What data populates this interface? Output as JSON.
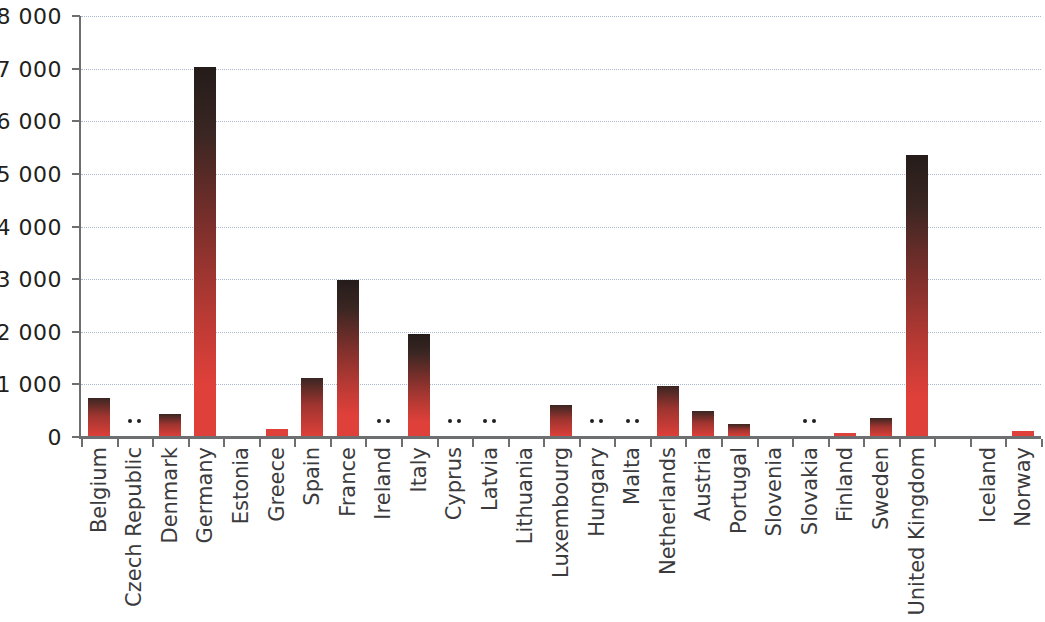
{
  "chart_data": {
    "type": "bar",
    "title": "",
    "subtitle": "",
    "xlabel": "",
    "ylabel": "",
    "ylim": [
      0,
      8000
    ],
    "y_ticks": [
      0,
      1000,
      2000,
      3000,
      4000,
      5000,
      6000,
      7000,
      8000
    ],
    "y_tick_labels": [
      "0",
      "1 000",
      "2 000",
      "3 000",
      "4 000",
      "5 000",
      "6 000",
      "7 000",
      "8 000"
    ],
    "grid": true,
    "legend": "none",
    "not_available_symbol": ":",
    "bar_color": "#e0403a",
    "bar_top_color": "#241c1a",
    "grid_color": "#a9b7cf",
    "axis_color": "#6d6e70",
    "label_color": "#3b3b3d",
    "categories": [
      "Belgium",
      "Czech Republic",
      "Denmark",
      "Germany",
      "Estonia",
      "Greece",
      "Spain",
      "France",
      "Ireland",
      "Italy",
      "Cyprus",
      "Latvia",
      "Lithuania",
      "Luxembourg",
      "Hungary",
      "Malta",
      "Netherlands",
      "Austria",
      "Portugal",
      "Slovenia",
      "Slovakia",
      "Finland",
      "Sweden",
      "United Kingdom",
      "",
      "Iceland",
      "Norway"
    ],
    "values": [
      750,
      null,
      430,
      7040,
      12,
      150,
      1120,
      2990,
      null,
      1950,
      null,
      null,
      10,
      610,
      null,
      null,
      960,
      490,
      250,
      18,
      null,
      75,
      370,
      5360,
      null,
      20,
      120
    ],
    "series": [
      {
        "name": "value",
        "values": [
          750,
          null,
          430,
          7040,
          12,
          150,
          1120,
          2990,
          null,
          1950,
          null,
          null,
          10,
          610,
          null,
          null,
          960,
          490,
          250,
          18,
          null,
          75,
          370,
          5360,
          null,
          20,
          120
        ]
      }
    ],
    "annotations": [
      {
        "category": "Czech Republic",
        "text": ":"
      },
      {
        "category": "Ireland",
        "text": ":"
      },
      {
        "category": "Cyprus",
        "text": ":"
      },
      {
        "category": "Latvia",
        "text": ":"
      },
      {
        "category": "Hungary",
        "text": ":"
      },
      {
        "category": "Malta",
        "text": ":"
      },
      {
        "category": "Slovakia",
        "text": ":"
      }
    ]
  }
}
